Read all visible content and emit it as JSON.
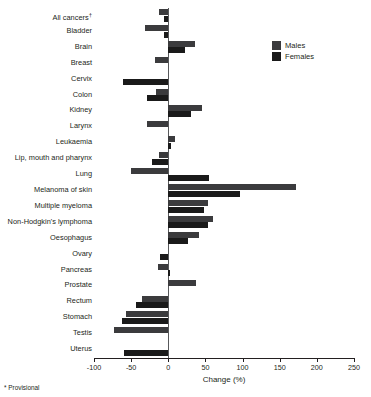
{
  "chart_data": {
    "type": "bar",
    "orientation": "horizontal",
    "title": "",
    "xlabel": "Change (%)",
    "ylabel": "",
    "xlim": [
      -100,
      250
    ],
    "xticks": [
      -100,
      -50,
      0,
      50,
      100,
      150,
      200,
      250
    ],
    "xtick_labels": [
      "-100",
      "-50",
      "0",
      "50",
      "100",
      "150",
      "200",
      "250"
    ],
    "grid": false,
    "legend_position": "top-right",
    "footnote": "* Provisional",
    "categories": [
      "All cancers†",
      "Bladder",
      "Brain",
      "Breast",
      "Cervix",
      "Colon",
      "Kidney",
      "Larynx",
      "Leukaemia",
      "Lip, mouth and pharynx",
      "Lung",
      "Melanoma of skin",
      "Multiple myeloma",
      "Non-Hodgkin's lymphoma",
      "Oesophagus",
      "Ovary",
      "Pancreas",
      "Prostate",
      "Rectum",
      "Stomach",
      "Testis",
      "Uterus"
    ],
    "series": [
      {
        "name": "Males",
        "color": "#3b3b3d",
        "values": [
          -13,
          -32,
          36,
          -18,
          null,
          -17,
          45,
          -29,
          9,
          -13,
          -50,
          172,
          54,
          60,
          42,
          null,
          -14,
          37,
          -36,
          -57,
          -73,
          null
        ]
      },
      {
        "name": "Females",
        "color": "#1a1a1a",
        "values": [
          -6,
          -6,
          23,
          null,
          -61,
          -28,
          30,
          null,
          3,
          -22,
          55,
          96,
          48,
          53,
          27,
          -11,
          2,
          null,
          -44,
          -62,
          null,
          -60
        ]
      }
    ]
  },
  "legend": {
    "items": [
      {
        "label": "Males",
        "color": "#3b3b3d"
      },
      {
        "label": "Females",
        "color": "#1a1a1a"
      }
    ]
  },
  "axis": {
    "title": "Change (%)"
  },
  "footnote": {
    "text": "* Provisional"
  }
}
